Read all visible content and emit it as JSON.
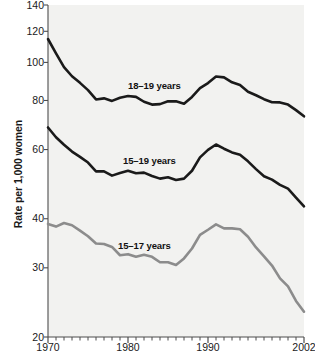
{
  "chart_data": {
    "type": "line",
    "title": "",
    "subtitle": "",
    "xlabel": "",
    "ylabel": "Rate per 1,000 women",
    "xlim": [
      1970,
      2002
    ],
    "ylim": [
      20,
      140
    ],
    "yscale": "log",
    "grid": false,
    "legend_position": "inline-annotations",
    "x_tick_labels": [
      "1970",
      "1980",
      "1990",
      "2002"
    ],
    "x_tick_values": [
      1970,
      1980,
      1990,
      2002
    ],
    "x_minor_ticks_every": 1,
    "y_tick_labels": [
      "140",
      "120",
      "100",
      "80",
      "60",
      "40",
      "30",
      "20"
    ],
    "y_tick_values": [
      140,
      120,
      100,
      80,
      60,
      40,
      30,
      20
    ],
    "x": [
      1970,
      1971,
      1972,
      1973,
      1974,
      1975,
      1976,
      1977,
      1978,
      1979,
      1980,
      1981,
      1982,
      1983,
      1984,
      1985,
      1986,
      1987,
      1988,
      1989,
      1990,
      1991,
      1992,
      1993,
      1994,
      1995,
      1996,
      1997,
      1998,
      1999,
      2000,
      2001,
      2002
    ],
    "series": [
      {
        "name": "18-19 years",
        "label": "18–19 years",
        "color": "#1a1a1a",
        "label_x": 128,
        "label_y": 80,
        "values": [
          114.7,
          105.5,
          97.3,
          92.2,
          88.7,
          85.0,
          80.5,
          81.0,
          79.8,
          81.3,
          82.1,
          81.7,
          79.4,
          78.1,
          78.3,
          79.6,
          79.6,
          78.5,
          81.7,
          86.0,
          88.6,
          92.1,
          91.6,
          89.0,
          87.6,
          84.2,
          82.5,
          80.6,
          79.2,
          79.1,
          78.1,
          75.6,
          72.9
        ]
      },
      {
        "name": "15-19 years",
        "label": "15–19 years",
        "color": "#1a1a1a",
        "label_x": 123,
        "label_y": 155,
        "values": [
          68.3,
          64.5,
          61.7,
          59.3,
          57.5,
          55.6,
          52.8,
          52.8,
          51.5,
          52.3,
          53.0,
          52.2,
          52.4,
          51.4,
          50.6,
          51.0,
          50.2,
          50.6,
          53.0,
          57.3,
          59.9,
          61.8,
          60.3,
          59.0,
          58.2,
          56.0,
          53.5,
          51.3,
          50.3,
          48.8,
          47.7,
          45.3,
          43.0
        ]
      },
      {
        "name": "15-17 years",
        "label": "15–17 years",
        "color": "#8c8c8c",
        "label_x": 118,
        "label_y": 240,
        "values": [
          38.8,
          38.2,
          39.0,
          38.5,
          37.3,
          36.1,
          34.6,
          34.5,
          33.9,
          32.3,
          32.5,
          32.0,
          32.4,
          32.0,
          31.0,
          31.0,
          30.5,
          31.7,
          33.6,
          36.4,
          37.5,
          38.7,
          37.8,
          37.8,
          37.6,
          36.0,
          33.8,
          32.1,
          30.4,
          28.2,
          26.9,
          24.7,
          23.2
        ]
      }
    ]
  },
  "axis": {
    "y_title": "Rate per 1,000 women"
  }
}
